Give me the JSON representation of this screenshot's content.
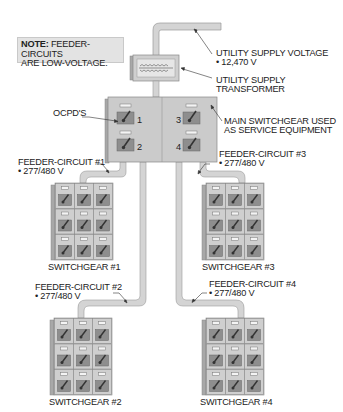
{
  "note": {
    "prefix": "NOTE:",
    "line1": " FEEDER-CIRCUITS",
    "line2": "ARE LOW-VOLTAGE."
  },
  "labels": {
    "utility_supply_voltage": "UTILITY SUPPLY VOLTAGE",
    "utility_supply_voltage_value": "• 12,470 V",
    "utility_supply_transformer_1": "UTILITY SUPPLY",
    "utility_supply_transformer_2": "TRANSFORMER",
    "ocpds": "OCPD'S",
    "main_switchgear_1": "MAIN SWITCHGEAR USED",
    "main_switchgear_2": "AS SERVICE EQUIPMENT"
  },
  "main_switchgear": {
    "ocpd_numbers": [
      "1",
      "2",
      "3",
      "4"
    ]
  },
  "feeders": [
    {
      "name": "FEEDER-CIRCUIT #1",
      "voltage": "• 277/480 V",
      "switchgear": "SWITCHGEAR #1"
    },
    {
      "name": "FEEDER-CIRCUIT #2",
      "voltage": "• 277/480 V",
      "switchgear": "SWITCHGEAR #2"
    },
    {
      "name": "FEEDER-CIRCUIT #3",
      "voltage": "• 277/480 V",
      "switchgear": "SWITCHGEAR #3"
    },
    {
      "name": "FEEDER-CIRCUIT #4",
      "voltage": "• 277/480 V",
      "switchgear": "SWITCHGEAR #4"
    }
  ],
  "colors": {
    "conduit_fill": "#d4d4d4",
    "conduit_stroke": "#9a9a9a",
    "cabinet_fill": "#c9c9c9",
    "cabinet_side": "#a8a8a8",
    "breaker_fill": "#8e8e8e",
    "note_bg": "#e3e3e3"
  }
}
